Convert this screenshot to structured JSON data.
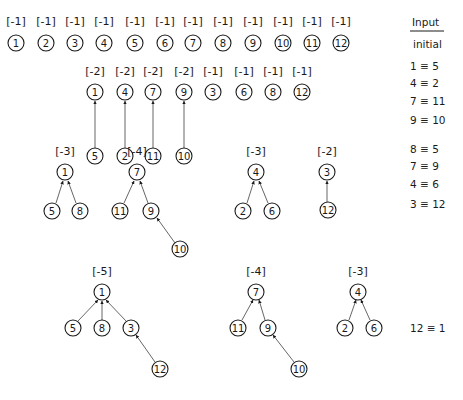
{
  "legend": {
    "header": "Input",
    "initial_label": "initial",
    "unions_step1": [
      "1 ≡ 5",
      "4 ≡ 2",
      "7 ≡ 11",
      "9 ≡ 10"
    ],
    "unions_step2": [
      "8 ≡ 5",
      "7 ≡ 9",
      "4 ≡ 6",
      "3 ≡ 12"
    ],
    "unions_step3": [
      "12 ≡ 1"
    ]
  },
  "stages": [
    {
      "name": "initial",
      "trees": [
        {
          "root": "1",
          "weight": "[-1]"
        },
        {
          "root": "2",
          "weight": "[-1]"
        },
        {
          "root": "3",
          "weight": "[-1]"
        },
        {
          "root": "4",
          "weight": "[-1]"
        },
        {
          "root": "5",
          "weight": "[-1]"
        },
        {
          "root": "6",
          "weight": "[-1]"
        },
        {
          "root": "7",
          "weight": "[-1]"
        },
        {
          "root": "8",
          "weight": "[-1]"
        },
        {
          "root": "9",
          "weight": "[-1]"
        },
        {
          "root": "10",
          "weight": "[-1]"
        },
        {
          "root": "11",
          "weight": "[-1]"
        },
        {
          "root": "12",
          "weight": "[-1]"
        }
      ]
    },
    {
      "name": "after-first-unions",
      "trees": [
        {
          "root": "1",
          "weight": "[-2]",
          "children": [
            "5"
          ]
        },
        {
          "root": "4",
          "weight": "[-2]",
          "children": [
            "2"
          ]
        },
        {
          "root": "7",
          "weight": "[-2]",
          "children": [
            "11"
          ]
        },
        {
          "root": "9",
          "weight": "[-2]",
          "children": [
            "10"
          ]
        },
        {
          "root": "3",
          "weight": "[-1]"
        },
        {
          "root": "6",
          "weight": "[-1]"
        },
        {
          "root": "8",
          "weight": "[-1]"
        },
        {
          "root": "12",
          "weight": "[-1]"
        }
      ]
    },
    {
      "name": "after-second-unions",
      "trees": [
        {
          "root": "1",
          "weight": "[-3]",
          "children": [
            "5",
            "8"
          ]
        },
        {
          "root": "7",
          "weight": "[-4]",
          "children": [
            "11",
            "9"
          ],
          "grandchildren": {
            "9": [
              "10"
            ]
          }
        },
        {
          "root": "4",
          "weight": "[-3]",
          "children": [
            "2",
            "6"
          ]
        },
        {
          "root": "3",
          "weight": "[-2]",
          "children": [
            "12"
          ]
        }
      ]
    },
    {
      "name": "after-third-union",
      "trees": [
        {
          "root": "1",
          "weight": "[-5]",
          "children": [
            "5",
            "8",
            "3"
          ],
          "grandchildren": {
            "3": [
              "12"
            ]
          }
        },
        {
          "root": "7",
          "weight": "[-4]",
          "children": [
            "11",
            "9"
          ],
          "grandchildren": {
            "9": [
              "10"
            ]
          }
        },
        {
          "root": "4",
          "weight": "[-3]",
          "children": [
            "2",
            "6"
          ]
        }
      ]
    }
  ]
}
